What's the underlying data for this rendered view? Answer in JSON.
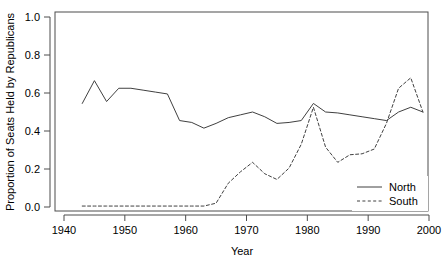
{
  "chart_data": {
    "type": "line",
    "title": "",
    "xlabel": "Year",
    "ylabel": "Proportion of Seats Held by Republicans",
    "xlim": [
      1937,
      2002
    ],
    "ylim": [
      0.0,
      1.0
    ],
    "grid": false,
    "legend_position": "bottom-right",
    "xticks": [
      1940,
      1950,
      1960,
      1970,
      1980,
      1990,
      2000
    ],
    "xtick_labels": [
      "1940",
      "1950",
      "1960",
      "1970",
      "1980",
      "1990",
      "2000"
    ],
    "yticks": [
      0.0,
      0.2,
      0.4,
      0.6,
      0.8,
      1.0
    ],
    "ytick_labels": [
      "0.0",
      "0.2",
      "0.4",
      "0.6",
      "0.8",
      "1.0"
    ],
    "series": [
      {
        "name": "North",
        "style": "solid",
        "color": "#404040",
        "x": [
          1943,
          1945,
          1947,
          1949,
          1951,
          1953,
          1955,
          1957,
          1959,
          1961,
          1963,
          1965,
          1967,
          1969,
          1971,
          1973,
          1975,
          1977,
          1979,
          1981,
          1983,
          1985,
          1987,
          1989,
          1991,
          1993,
          1995,
          1997,
          1999
        ],
        "values": [
          0.545,
          0.665,
          0.555,
          0.625,
          0.625,
          0.615,
          0.605,
          0.595,
          0.455,
          0.445,
          0.415,
          0.44,
          0.47,
          0.485,
          0.5,
          0.475,
          0.44,
          0.445,
          0.455,
          0.545,
          0.5,
          0.495,
          0.485,
          0.475,
          0.465,
          0.455,
          0.5,
          0.525,
          0.5
        ]
      },
      {
        "name": "South",
        "style": "dashed",
        "color": "#404040",
        "x": [
          1943,
          1945,
          1947,
          1949,
          1951,
          1953,
          1955,
          1957,
          1959,
          1961,
          1963,
          1965,
          1967,
          1969,
          1971,
          1973,
          1975,
          1977,
          1979,
          1981,
          1983,
          1985,
          1987,
          1989,
          1991,
          1993,
          1995,
          1997,
          1999
        ],
        "values": [
          0.005,
          0.005,
          0.005,
          0.005,
          0.005,
          0.005,
          0.005,
          0.005,
          0.005,
          0.005,
          0.005,
          0.02,
          0.125,
          0.185,
          0.235,
          0.175,
          0.145,
          0.205,
          0.33,
          0.525,
          0.315,
          0.235,
          0.275,
          0.28,
          0.305,
          0.44,
          0.625,
          0.68,
          0.5
        ]
      }
    ],
    "legend_entries": [
      {
        "label": "North",
        "style": "solid"
      },
      {
        "label": "South",
        "style": "dashed"
      }
    ]
  }
}
